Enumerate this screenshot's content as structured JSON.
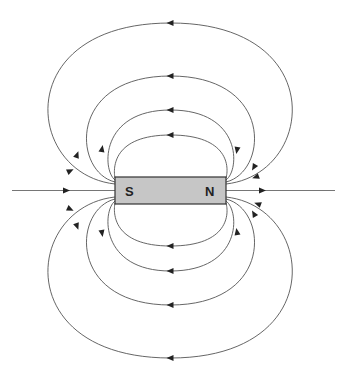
{
  "diagram": {
    "magnet": {
      "left_pole_label": "S",
      "right_pole_label": "N",
      "color": "#c6c6c6"
    },
    "field_direction": "N to S outside the magnet",
    "loops_above": 4,
    "loops_below": 4,
    "axial_lines": 2
  }
}
